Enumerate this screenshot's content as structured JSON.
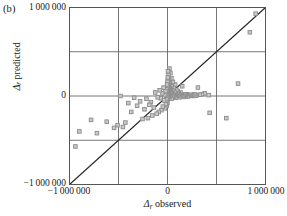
{
  "panel": {
    "label": "(b)"
  },
  "chart_data": {
    "type": "scatter",
    "title": "",
    "xlabel": "Δr observed",
    "ylabel": "Δr predicted",
    "xlabel_symbol": "Δ",
    "xlabel_sub": "r",
    "xlabel_rest": " observed",
    "ylabel_symbol": "Δ",
    "ylabel_sub": "r",
    "ylabel_rest": " predicted",
    "xlim": [
      -1000000,
      1000000
    ],
    "ylim": [
      -1000000,
      1000000
    ],
    "xticks": [
      -1000000,
      0,
      1000000
    ],
    "xtick_labels": [
      "−1 000 000",
      "0",
      "1 000 000"
    ],
    "yticks": [
      -1000000,
      0,
      1000000
    ],
    "ytick_labels": [
      "−1 000 000",
      "0",
      "1 000 000"
    ],
    "grid": true,
    "gridlines_x": [
      -500000,
      0,
      500000
    ],
    "gridlines_y": [
      -500000,
      0,
      500000
    ],
    "legend": "none",
    "marker": "open-square",
    "marker_color": "#8c8c8c",
    "marker_fill": "#c8c8c8",
    "reference_line": {
      "name": "one-to-one-line",
      "from": [
        -1000000,
        -1000000
      ],
      "to": [
        1000000,
        1000000
      ],
      "color": "#262626"
    },
    "points": [
      [
        900000,
        930000
      ],
      [
        840000,
        720000
      ],
      [
        720000,
        140000
      ],
      [
        600000,
        -250000
      ],
      [
        430000,
        -190000
      ],
      [
        420000,
        10000
      ],
      [
        380000,
        30000
      ],
      [
        350000,
        20000
      ],
      [
        330000,
        15000
      ],
      [
        310000,
        95000
      ],
      [
        300000,
        10000
      ],
      [
        290000,
        5000
      ],
      [
        275000,
        20000
      ],
      [
        262000,
        0
      ],
      [
        250000,
        10000
      ],
      [
        238000,
        5000
      ],
      [
        225000,
        15000
      ],
      [
        215000,
        0
      ],
      [
        205000,
        -5000
      ],
      [
        195000,
        20000
      ],
      [
        188000,
        10000
      ],
      [
        180000,
        0
      ],
      [
        172000,
        15000
      ],
      [
        165000,
        -10000
      ],
      [
        158000,
        5000
      ],
      [
        150000,
        110000
      ],
      [
        145000,
        20000
      ],
      [
        138000,
        0
      ],
      [
        132000,
        40000
      ],
      [
        126000,
        10000
      ],
      [
        120000,
        -15000
      ],
      [
        115000,
        30000
      ],
      [
        110000,
        5000
      ],
      [
        105000,
        55000
      ],
      [
        100000,
        15000
      ],
      [
        95000,
        0
      ],
      [
        90000,
        70000
      ],
      [
        86000,
        25000
      ],
      [
        82000,
        -20000
      ],
      [
        78000,
        130000
      ],
      [
        74000,
        10000
      ],
      [
        70000,
        45000
      ],
      [
        66000,
        -5000
      ],
      [
        62000,
        90000
      ],
      [
        58000,
        20000
      ],
      [
        55000,
        160000
      ],
      [
        52000,
        0
      ],
      [
        48000,
        65000
      ],
      [
        45000,
        30000
      ],
      [
        42000,
        -30000
      ],
      [
        40000,
        200000
      ],
      [
        38000,
        110000
      ],
      [
        35000,
        15000
      ],
      [
        33000,
        75000
      ],
      [
        30000,
        260000
      ],
      [
        28000,
        40000
      ],
      [
        26000,
        -10000
      ],
      [
        24000,
        150000
      ],
      [
        22000,
        90000
      ],
      [
        20000,
        310000
      ],
      [
        18000,
        55000
      ],
      [
        16000,
        20000
      ],
      [
        15000,
        185000
      ],
      [
        14000,
        125000
      ],
      [
        12000,
        0
      ],
      [
        11000,
        70000
      ],
      [
        10000,
        240000
      ],
      [
        9000,
        35000
      ],
      [
        8000,
        140000
      ],
      [
        7000,
        95000
      ],
      [
        6000,
        10000
      ],
      [
        5000,
        280000
      ],
      [
        4500,
        180000
      ],
      [
        4000,
        60000
      ],
      [
        3500,
        25000
      ],
      [
        3000,
        210000
      ],
      [
        2500,
        120000
      ],
      [
        2000,
        0
      ],
      [
        1500,
        80000
      ],
      [
        1000,
        160000
      ],
      [
        500,
        40000
      ],
      [
        0,
        0
      ],
      [
        -500,
        30000
      ],
      [
        -1000,
        -40000
      ],
      [
        -1500,
        100000
      ],
      [
        -2000,
        -80000
      ],
      [
        -2500,
        60000
      ],
      [
        -3000,
        -20000
      ],
      [
        -4000,
        130000
      ],
      [
        -5000,
        -60000
      ],
      [
        -6000,
        45000
      ],
      [
        -8000,
        -110000
      ],
      [
        -10000,
        75000
      ],
      [
        -12000,
        -35000
      ],
      [
        -15000,
        20000
      ],
      [
        -18000,
        -90000
      ],
      [
        -20000,
        55000
      ],
      [
        -25000,
        -140000
      ],
      [
        -30000,
        10000
      ],
      [
        -35000,
        -50000
      ],
      [
        -40000,
        95000
      ],
      [
        -48000,
        -120000
      ],
      [
        -55000,
        30000
      ],
      [
        -62000,
        -160000
      ],
      [
        -70000,
        -25000
      ],
      [
        -80000,
        65000
      ],
      [
        -90000,
        -180000
      ],
      [
        -100000,
        -15000
      ],
      [
        -110000,
        -200000
      ],
      [
        -125000,
        40000
      ],
      [
        -140000,
        -130000
      ],
      [
        -155000,
        -220000
      ],
      [
        -170000,
        -70000
      ],
      [
        -185000,
        -100000
      ],
      [
        -200000,
        -250000
      ],
      [
        -215000,
        -30000
      ],
      [
        -235000,
        -150000
      ],
      [
        -255000,
        -260000
      ],
      [
        -280000,
        -60000
      ],
      [
        -310000,
        -110000
      ],
      [
        -340000,
        -20000
      ],
      [
        -370000,
        -180000
      ],
      [
        -400000,
        -80000
      ],
      [
        -430000,
        -300000
      ],
      [
        -455000,
        -350000
      ],
      [
        -480000,
        0
      ],
      [
        -510000,
        -330000
      ],
      [
        -545000,
        -360000
      ],
      [
        -620000,
        -290000
      ],
      [
        -720000,
        -420000
      ],
      [
        -780000,
        -270000
      ],
      [
        -900000,
        -400000
      ],
      [
        -940000,
        -570000
      ]
    ]
  }
}
